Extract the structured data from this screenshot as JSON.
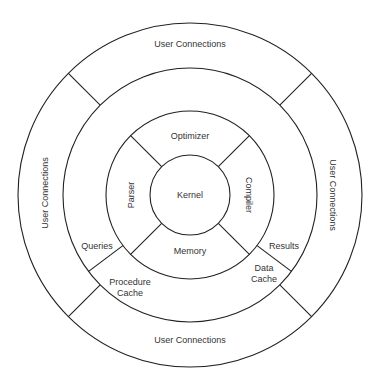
{
  "diagram": {
    "center": {
      "x": 190,
      "y": 195
    },
    "rings": {
      "outer_radius": 172,
      "middle_radius": 127,
      "inner_radius": 84,
      "kernel_radius": 40
    },
    "colors": {
      "stroke": "#222222",
      "text": "#333333",
      "background": "#ffffff"
    },
    "outer_ring": {
      "top_label": "User Connections",
      "left_label": "User Connections",
      "right_label": "User Connections",
      "bottom_label": "User Connections"
    },
    "middle_ring": {
      "queries_label": "Queries",
      "results_label": "Results",
      "procedure_cache_line1": "Procedure",
      "procedure_cache_line2": "Cache",
      "data_cache_line1": "Data",
      "data_cache_line2": "Cache"
    },
    "inner_ring": {
      "optimizer_label": "Optimizer",
      "parser_label": "Parser",
      "compiler_label": "Compiler",
      "memory_label": "Memory"
    },
    "core": {
      "kernel_label": "Kernel"
    }
  }
}
